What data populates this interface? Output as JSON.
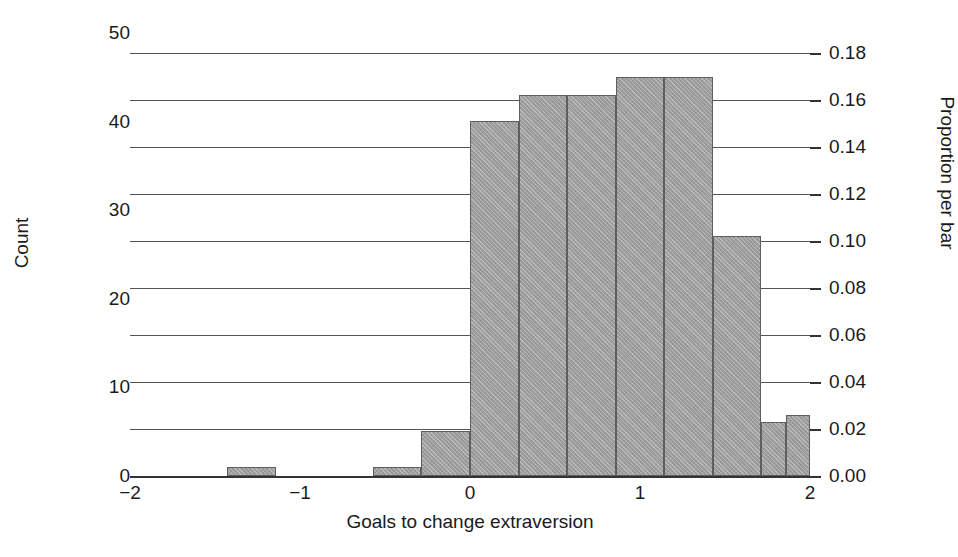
{
  "chart_data": {
    "type": "bar",
    "title": "",
    "subtitle": "",
    "xlabel": "Goals to change extraversion",
    "ylabel": "Count",
    "ylabel_right": "Proportion per bar",
    "grid": true,
    "legend": null,
    "xlim": [
      -2,
      2
    ],
    "ylim": [
      0,
      50
    ],
    "ylim_right": [
      0.0,
      0.18
    ],
    "bin_width": 0.2857,
    "total_n": 265,
    "xticks": [
      -2,
      -1,
      0,
      1,
      2
    ],
    "xtick_labels": [
      "−2",
      "−1",
      "0",
      "1",
      "2"
    ],
    "yticks_left": [
      0,
      10,
      20,
      30,
      40,
      50
    ],
    "ytick_labels_left": [
      "0",
      "10",
      "20",
      "30",
      "40",
      "50"
    ],
    "yticks_right": [
      0.0,
      0.02,
      0.04,
      0.06,
      0.08,
      0.1,
      0.12,
      0.14,
      0.16,
      0.18
    ],
    "ytick_labels_right": [
      "0.00",
      "0.02",
      "0.04",
      "0.06",
      "0.08",
      "0.10",
      "0.12",
      "0.14",
      "0.16",
      "0.18"
    ],
    "bars": [
      {
        "bin_start": -2.0,
        "bin_end": -1.714,
        "count": 0,
        "proportion": 0.0
      },
      {
        "bin_start": -1.714,
        "bin_end": -1.429,
        "count": 0,
        "proportion": 0.0
      },
      {
        "bin_start": -1.429,
        "bin_end": -1.143,
        "count": 1,
        "proportion": 0.004
      },
      {
        "bin_start": -1.143,
        "bin_end": -0.857,
        "count": 0,
        "proportion": 0.0
      },
      {
        "bin_start": -0.857,
        "bin_end": -0.571,
        "count": 0,
        "proportion": 0.0
      },
      {
        "bin_start": -0.571,
        "bin_end": -0.286,
        "count": 1,
        "proportion": 0.004
      },
      {
        "bin_start": -0.286,
        "bin_end": 0.0,
        "count": 5,
        "proportion": 0.019
      },
      {
        "bin_start": 0.0,
        "bin_end": 0.286,
        "count": 40,
        "proportion": 0.151
      },
      {
        "bin_start": 0.286,
        "bin_end": 0.571,
        "count": 43,
        "proportion": 0.162
      },
      {
        "bin_start": 0.571,
        "bin_end": 0.857,
        "count": 43,
        "proportion": 0.162
      },
      {
        "bin_start": 0.857,
        "bin_end": 1.143,
        "count": 45,
        "proportion": 0.17
      },
      {
        "bin_start": 1.143,
        "bin_end": 1.429,
        "count": 45,
        "proportion": 0.17
      },
      {
        "bin_start": 1.429,
        "bin_end": 1.714,
        "count": 27,
        "proportion": 0.102
      },
      {
        "bin_start": 1.714,
        "bin_end": 1.857,
        "count": 6,
        "proportion": 0.023
      },
      {
        "bin_start": 1.857,
        "bin_end": 2.0,
        "count": 7,
        "proportion": 0.026
      }
    ],
    "colors": {
      "bar_fill": "#9d9d9d",
      "bar_edge": "#5e5e5e",
      "gridline": "#555555",
      "axis": "#333333",
      "text": "#1a1a1a",
      "background": "#ffffff"
    }
  }
}
